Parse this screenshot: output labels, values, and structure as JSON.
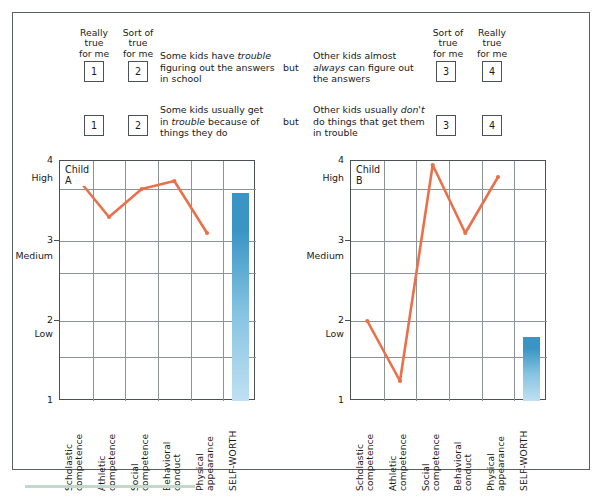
{
  "figure": {
    "accent_line_color": "#e8714a",
    "bar_color_top": "#3a95c4",
    "bar_color_bottom": "#bfe0f2",
    "grid_color": "#8d9295",
    "frame_color": "#5a5f63",
    "rule_color": "#c3d8c8"
  },
  "scale_headers": {
    "left": [
      {
        "name": "really-true-for-me",
        "text": "Really\ntrue\nfor me"
      },
      {
        "name": "sort-of-true-for-me",
        "text": "Sort of\ntrue\nfor me"
      }
    ],
    "right": [
      {
        "name": "sort-of-true-for-me",
        "text": "Sort of\ntrue\nfor me"
      },
      {
        "name": "really-true-for-me",
        "text": "Really\ntrue\nfor me"
      }
    ]
  },
  "items": [
    {
      "left_boxes": [
        "1",
        "2"
      ],
      "right_boxes": [
        "3",
        "4"
      ],
      "left_statement_html": "Some kids have <i>trouble</i><br>figuring out the answers<br>in school",
      "connector": "but",
      "right_statement_html": "Other kids almost<br><i>always</i> can figure out<br>the answers"
    },
    {
      "left_boxes": [
        "1",
        "2"
      ],
      "right_boxes": [
        "3",
        "4"
      ],
      "left_statement_html": "Some kids usually get<br>in <i>trouble</i> because of<br>things they do",
      "connector": "but",
      "right_statement_html": "Other kids usually <i>don't</i><br>do things that get them<br>in trouble"
    }
  ],
  "chart_data": [
    {
      "type": "line",
      "name": "child-a",
      "title": "Child A",
      "categories": [
        "Scholastic\ncompetence",
        "Athletic\ncompetence",
        "Social\ncompetence",
        "Behavioral\nconduct",
        "Physical\nappearance",
        "SELF-WORTH"
      ],
      "values": [
        3.8,
        3.3,
        3.65,
        3.75,
        3.1
      ],
      "self_worth_bar": 3.6,
      "ylim": [
        1,
        4
      ],
      "ytick_values": [
        4,
        3,
        2,
        1
      ],
      "ytick_labels": [
        "4",
        "3",
        "2",
        "1"
      ],
      "yband_labels": [
        {
          "label": "High",
          "value": 3.78
        },
        {
          "label": "Medium",
          "value": 2.8
        },
        {
          "label": "Low",
          "value": 1.82
        }
      ],
      "gridline_values": [
        3.65,
        3.0,
        2.6,
        2.0,
        1.55
      ],
      "grid": true,
      "xlabel": "",
      "ylabel": ""
    },
    {
      "type": "line",
      "name": "child-b",
      "title": "Child B",
      "categories": [
        "Scholastic\ncompetence",
        "Athletic\ncompetence",
        "Social\ncompetence",
        "Behavioral\nconduct",
        "Physical\nappearance",
        "SELF-WORTH"
      ],
      "values": [
        2.0,
        1.25,
        3.95,
        3.1,
        3.8
      ],
      "self_worth_bar": 1.8,
      "ylim": [
        1,
        4
      ],
      "ytick_values": [
        4,
        3,
        2,
        1
      ],
      "ytick_labels": [
        "4",
        "3",
        "2",
        "1"
      ],
      "yband_labels": [
        {
          "label": "High",
          "value": 3.78
        },
        {
          "label": "Medium",
          "value": 2.8
        },
        {
          "label": "Low",
          "value": 1.82
        }
      ],
      "gridline_values": [
        3.65,
        3.0,
        2.6,
        2.0,
        1.55
      ],
      "grid": true,
      "xlabel": "",
      "ylabel": ""
    }
  ]
}
